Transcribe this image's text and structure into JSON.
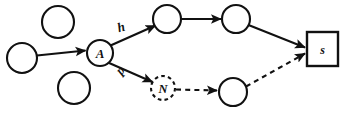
{
  "diagram": {
    "background_color": "#ffffff",
    "stroke_color": "#111111",
    "nodes": [
      {
        "id": "c-top-left",
        "name": "circle-node-top-left",
        "shape": "circle",
        "label": "",
        "style": "solid",
        "cx": 58,
        "cy": 22,
        "r": 16
      },
      {
        "id": "c-mid-left",
        "name": "circle-node-mid-left",
        "shape": "circle",
        "label": "",
        "style": "solid",
        "cx": 22,
        "cy": 58,
        "r": 15
      },
      {
        "id": "c-bottom-left",
        "name": "circle-node-bottom-left",
        "shape": "circle",
        "label": "",
        "style": "solid",
        "cx": 74,
        "cy": 88,
        "r": 16
      },
      {
        "id": "node-a",
        "name": "node-a",
        "shape": "circle",
        "label": "A",
        "style": "solid",
        "cx": 100,
        "cy": 53,
        "r": 13
      },
      {
        "id": "c-upper-1",
        "name": "circle-node-upper-first",
        "shape": "circle",
        "label": "",
        "style": "solid",
        "cx": 167,
        "cy": 19,
        "r": 14
      },
      {
        "id": "c-upper-2",
        "name": "circle-node-upper-second",
        "shape": "circle",
        "label": "",
        "style": "solid",
        "cx": 236,
        "cy": 19,
        "r": 14
      },
      {
        "id": "node-n",
        "name": "node-n",
        "shape": "circle",
        "label": "N",
        "style": "dashed",
        "cx": 163,
        "cy": 88,
        "r": 12
      },
      {
        "id": "c-lower-1",
        "name": "circle-node-lower-first",
        "shape": "circle",
        "label": "",
        "style": "solid",
        "cx": 233,
        "cy": 92,
        "r": 14
      },
      {
        "id": "node-s",
        "name": "node-s",
        "shape": "square",
        "label": "s",
        "style": "solid",
        "x": 307,
        "y": 32,
        "w": 31,
        "h": 34
      }
    ],
    "edges": [
      {
        "id": "e1",
        "name": "edge-midleft-to-a",
        "from": "c-mid-left",
        "to": "node-a",
        "style": "solid",
        "label": ""
      },
      {
        "id": "e2",
        "name": "edge-a-to-upper-h",
        "from": "node-a",
        "to": "c-upper-1",
        "style": "solid",
        "label": "h"
      },
      {
        "id": "e3",
        "name": "edge-a-to-n-p",
        "from": "node-a",
        "to": "node-n",
        "style": "solid",
        "label": "p"
      },
      {
        "id": "e4",
        "name": "edge-upper1-to-upper2",
        "from": "c-upper-1",
        "to": "c-upper-2",
        "style": "solid",
        "label": ""
      },
      {
        "id": "e5",
        "name": "edge-upper2-to-s",
        "from": "c-upper-2",
        "to": "node-s",
        "style": "solid",
        "label": ""
      },
      {
        "id": "e6",
        "name": "edge-n-to-lower1",
        "from": "node-n",
        "to": "c-lower-1",
        "style": "dashed",
        "label": ""
      },
      {
        "id": "e7",
        "name": "edge-lower1-to-s",
        "from": "c-lower-1",
        "to": "node-s",
        "style": "dashed",
        "label": ""
      }
    ],
    "labels": {
      "node_a": "A",
      "node_n": "N",
      "node_s": "s",
      "edge_h": "h",
      "edge_p": "p"
    }
  }
}
